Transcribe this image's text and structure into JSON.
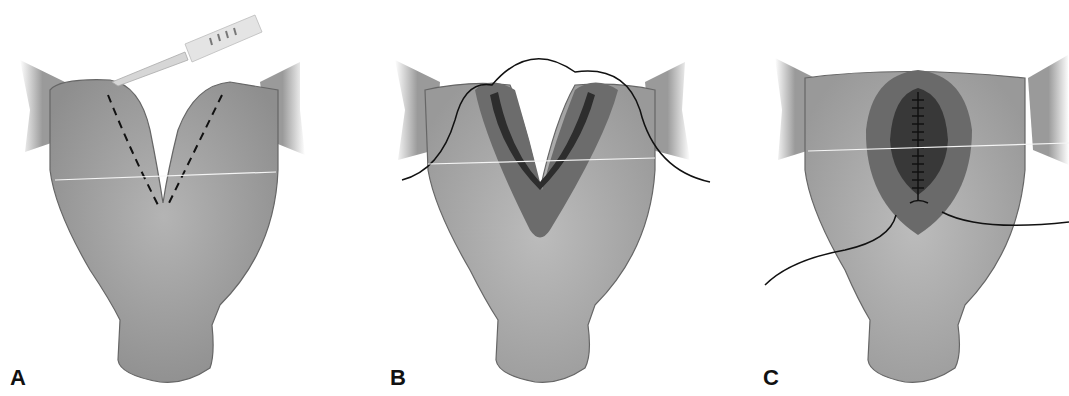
{
  "figure": {
    "panels": [
      {
        "id": "A",
        "label": "A",
        "description": "Uterus with dashed incision lines and scalpel"
      },
      {
        "id": "B",
        "label": "B",
        "description": "Incised septum with suture placed through both halves"
      },
      {
        "id": "C",
        "label": "C",
        "description": "Closed incision with running suture line"
      }
    ],
    "colors": {
      "tissue": "#9a9a9a",
      "tissue_light": "#bdbdbd",
      "incision_dark": "#555555",
      "incision_inner": "#3a3a3a",
      "suture": "#111111",
      "outline": "#555555"
    }
  }
}
